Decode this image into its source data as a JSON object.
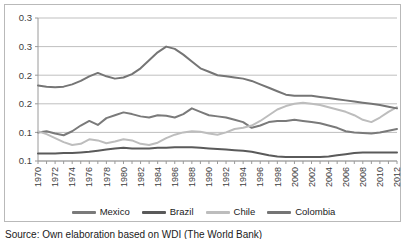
{
  "chart_data": {
    "type": "line",
    "title": "",
    "xlabel": "",
    "ylabel": "",
    "grid": true,
    "legend_position": "bottom",
    "ylim": [
      0.1,
      0.35
    ],
    "yticks": [
      0.1,
      0.15,
      0.2,
      0.25,
      0.3,
      0.35
    ],
    "ytick_labels": [
      "0.1",
      "0.1",
      "0.2",
      "0.2",
      "0.3",
      "0.3"
    ],
    "xlim": [
      1970,
      2012
    ],
    "x": [
      1970,
      1971,
      1972,
      1973,
      1974,
      1975,
      1976,
      1977,
      1978,
      1979,
      1980,
      1981,
      1982,
      1983,
      1984,
      1985,
      1986,
      1987,
      1988,
      1989,
      1990,
      1991,
      1992,
      1993,
      1994,
      1995,
      1996,
      1997,
      1998,
      1999,
      2000,
      2001,
      2002,
      2003,
      2004,
      2005,
      2006,
      2007,
      2008,
      2009,
      2010,
      2011,
      2012
    ],
    "xtick_labels": [
      "1970",
      "1972",
      "1974",
      "1976",
      "1978",
      "1980",
      "1982",
      "1984",
      "1986",
      "1988",
      "1990",
      "1992",
      "1994",
      "1996",
      "1998",
      "2000",
      "2002",
      "2004",
      "2006",
      "2008",
      "2010",
      "2012"
    ],
    "series": [
      {
        "name": "Mexico",
        "color": "#7a7a7a",
        "values": [
          0.15,
          0.152,
          0.148,
          0.145,
          0.152,
          0.162,
          0.17,
          0.163,
          0.175,
          0.18,
          0.185,
          0.182,
          0.178,
          0.176,
          0.18,
          0.179,
          0.176,
          0.182,
          0.192,
          0.186,
          0.18,
          0.178,
          0.176,
          0.172,
          0.168,
          0.158,
          0.162,
          0.168,
          0.17,
          0.17,
          0.172,
          0.17,
          0.168,
          0.166,
          0.162,
          0.158,
          0.152,
          0.15,
          0.149,
          0.148,
          0.15,
          0.153,
          0.156
        ]
      },
      {
        "name": "Brazil",
        "color": "#5a5a5a",
        "values": [
          0.113,
          0.113,
          0.113,
          0.114,
          0.114,
          0.115,
          0.116,
          0.118,
          0.12,
          0.122,
          0.123,
          0.122,
          0.122,
          0.122,
          0.123,
          0.123,
          0.124,
          0.124,
          0.124,
          0.123,
          0.122,
          0.121,
          0.12,
          0.119,
          0.118,
          0.116,
          0.113,
          0.11,
          0.108,
          0.107,
          0.107,
          0.107,
          0.107,
          0.107,
          0.108,
          0.11,
          0.112,
          0.114,
          0.115,
          0.115,
          0.115,
          0.115,
          0.115
        ]
      },
      {
        "name": "Chile",
        "color": "#bdbdbd",
        "values": [
          0.152,
          0.147,
          0.14,
          0.133,
          0.128,
          0.13,
          0.138,
          0.136,
          0.131,
          0.134,
          0.138,
          0.136,
          0.13,
          0.128,
          0.132,
          0.14,
          0.146,
          0.15,
          0.152,
          0.151,
          0.148,
          0.146,
          0.15,
          0.156,
          0.158,
          0.162,
          0.17,
          0.18,
          0.19,
          0.196,
          0.2,
          0.202,
          0.2,
          0.198,
          0.194,
          0.19,
          0.186,
          0.18,
          0.172,
          0.168,
          0.176,
          0.186,
          0.194
        ]
      },
      {
        "name": "Colombia",
        "color": "#757575",
        "values": [
          0.232,
          0.23,
          0.229,
          0.23,
          0.234,
          0.24,
          0.248,
          0.254,
          0.248,
          0.244,
          0.246,
          0.252,
          0.262,
          0.276,
          0.29,
          0.3,
          0.296,
          0.286,
          0.274,
          0.262,
          0.256,
          0.25,
          0.248,
          0.246,
          0.244,
          0.24,
          0.234,
          0.228,
          0.222,
          0.216,
          0.214,
          0.214,
          0.214,
          0.212,
          0.21,
          0.208,
          0.206,
          0.204,
          0.202,
          0.2,
          0.198,
          0.195,
          0.192
        ]
      }
    ]
  },
  "legend": {
    "items": [
      {
        "label": "Mexico",
        "color": "#7a7a7a"
      },
      {
        "label": "Brazil",
        "color": "#5a5a5a"
      },
      {
        "label": "Chile",
        "color": "#bdbdbd"
      },
      {
        "label": "Colombia",
        "color": "#757575"
      }
    ]
  },
  "caption": {
    "text": "Source: Own elaboration based on WDI (The World Bank)"
  }
}
